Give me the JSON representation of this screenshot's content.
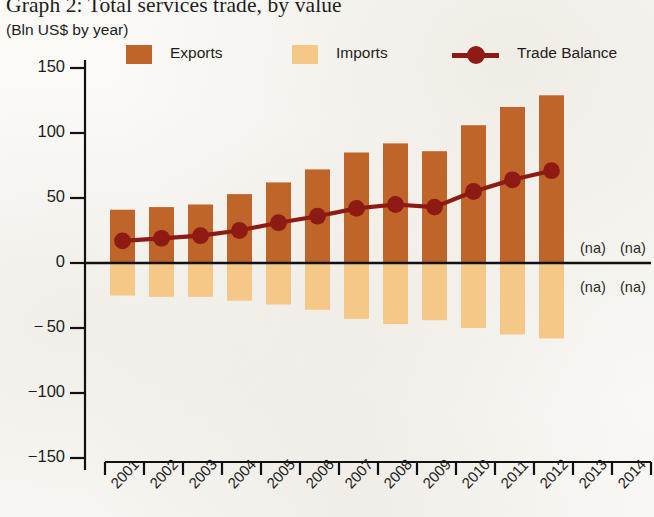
{
  "title": "Graph 2: Total services trade, by value",
  "subtitle": "(Bln US$ by year)",
  "legend": {
    "exports": {
      "label": "Exports",
      "color": "#c0652a",
      "icon": "square-swatch"
    },
    "imports": {
      "label": "Imports",
      "color": "#f5c888",
      "icon": "square-swatch"
    },
    "balance": {
      "label": "Trade Balance",
      "color": "#8e1a14",
      "icon": "line-marker-swatch"
    }
  },
  "na_labels": [
    {
      "text": "(na)",
      "x": 580,
      "y": 240
    },
    {
      "text": "(na)",
      "x": 620,
      "y": 240
    },
    {
      "text": "(na)",
      "x": 580,
      "y": 279
    },
    {
      "text": "(na)",
      "x": 620,
      "y": 279
    }
  ],
  "chart_data": {
    "type": "bar",
    "title": "Graph 2: Total services trade, by value",
    "subtitle": "(Bln US$ by year)",
    "xlabel": "",
    "ylabel": "Bln US$",
    "ylim": [
      -150,
      150
    ],
    "ytick_values": [
      150,
      100,
      50,
      0,
      -50,
      -100,
      -150
    ],
    "ytick_labels": [
      "150",
      "100",
      "50",
      "0",
      "− 50",
      "−100",
      "−150"
    ],
    "grid": false,
    "legend_position": "top",
    "categories": [
      "2001",
      "2002",
      "2003",
      "2004",
      "2005",
      "2006",
      "2007",
      "2008",
      "2009",
      "2010",
      "2011",
      "2012",
      "2013",
      "2014"
    ],
    "series": [
      {
        "name": "Exports",
        "type": "bar",
        "color": "#c0652a",
        "values": [
          41,
          43,
          45,
          53,
          62,
          72,
          85,
          92,
          86,
          106,
          120,
          129,
          null,
          null
        ]
      },
      {
        "name": "Imports",
        "type": "bar",
        "color": "#f5c888",
        "values": [
          -25,
          -26,
          -26,
          -29,
          -32,
          -36,
          -43,
          -47,
          -44,
          -50,
          -55,
          -58,
          null,
          null
        ]
      },
      {
        "name": "Trade Balance",
        "type": "line",
        "color": "#8e1a14",
        "values": [
          17,
          19,
          21,
          25,
          31,
          36,
          42,
          45,
          43,
          55,
          64,
          71,
          null,
          null
        ]
      }
    ],
    "missing_marker": "(na)"
  }
}
